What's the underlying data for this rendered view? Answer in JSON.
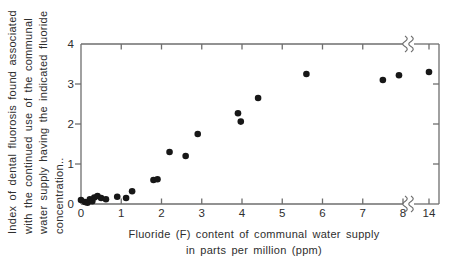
{
  "figure": {
    "background": "#ffffff",
    "line_color": "#6e6e6e",
    "text_color": "#2e2e2e",
    "dot_color": "#171717"
  },
  "chart_data": {
    "type": "scatter",
    "title": "",
    "ylabel_lines": [
      "Index of dental fluorosis found associated",
      "with the continued use of the communal",
      "water supply having the indicated fluoride",
      "concentration.."
    ],
    "xlabel_lines": [
      "Fluoride (F) content of communal water supply",
      "in parts per million (ppm)"
    ],
    "x_ticks": [
      0,
      1,
      2,
      3,
      4,
      5,
      6,
      7,
      8,
      14
    ],
    "y_ticks": [
      0,
      1,
      2,
      3,
      4
    ],
    "ylim": [
      0,
      4
    ],
    "axis_break": {
      "axis": "x",
      "between": [
        8,
        14
      ]
    },
    "grid": false,
    "legend": "none",
    "points": [
      [
        0.0,
        0.1
      ],
      [
        0.1,
        0.05
      ],
      [
        0.16,
        0.03
      ],
      [
        0.22,
        0.12
      ],
      [
        0.28,
        0.07
      ],
      [
        0.33,
        0.16
      ],
      [
        0.41,
        0.2
      ],
      [
        0.5,
        0.15
      ],
      [
        0.62,
        0.12
      ],
      [
        0.9,
        0.18
      ],
      [
        1.12,
        0.15
      ],
      [
        1.27,
        0.32
      ],
      [
        1.8,
        0.6
      ],
      [
        1.9,
        0.62
      ],
      [
        2.2,
        1.3
      ],
      [
        2.6,
        1.2
      ],
      [
        2.9,
        1.75
      ],
      [
        3.9,
        2.27
      ],
      [
        3.97,
        2.06
      ],
      [
        4.4,
        2.65
      ],
      [
        5.6,
        3.25
      ],
      [
        7.5,
        3.1
      ],
      [
        7.9,
        3.22
      ],
      [
        14.0,
        3.3
      ]
    ]
  }
}
